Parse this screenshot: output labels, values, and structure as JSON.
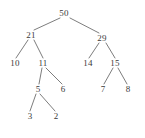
{
  "figure": {
    "kind": "binary-tree-diagram",
    "width": 145,
    "height": 138,
    "background_color": "#ffffff",
    "ink_color": "#3a3a3a",
    "edge_color": "#6e6e6e"
  },
  "chart_data": {
    "type": "diagram",
    "subtype": "binary-tree",
    "title": "",
    "root": "50",
    "nodes": [
      {
        "id": "n50",
        "label": "50",
        "x": 64,
        "y": 13,
        "depth": 0
      },
      {
        "id": "n21",
        "label": "21",
        "x": 31,
        "y": 35,
        "depth": 1
      },
      {
        "id": "n29",
        "label": "29",
        "x": 102,
        "y": 38,
        "depth": 1
      },
      {
        "id": "n10",
        "label": "10",
        "x": 15,
        "y": 63,
        "depth": 2
      },
      {
        "id": "n11",
        "label": "11",
        "x": 43,
        "y": 63,
        "depth": 2
      },
      {
        "id": "n14",
        "label": "14",
        "x": 88,
        "y": 63,
        "depth": 2
      },
      {
        "id": "n15",
        "label": "15",
        "x": 115,
        "y": 63,
        "depth": 2
      },
      {
        "id": "n5",
        "label": "5",
        "x": 38,
        "y": 89,
        "depth": 3
      },
      {
        "id": "n6",
        "label": "6",
        "x": 63,
        "y": 89,
        "depth": 3
      },
      {
        "id": "n7",
        "label": "7",
        "x": 103,
        "y": 89,
        "depth": 3
      },
      {
        "id": "n8",
        "label": "8",
        "x": 128,
        "y": 89,
        "depth": 3
      },
      {
        "id": "n3",
        "label": "3",
        "x": 30,
        "y": 116,
        "depth": 4
      },
      {
        "id": "n2",
        "label": "2",
        "x": 56,
        "y": 116,
        "depth": 4
      }
    ],
    "edges": [
      {
        "from": "n50",
        "to": "n21",
        "x1": 60,
        "y1": 18,
        "x2": 34,
        "y2": 30
      },
      {
        "from": "n50",
        "to": "n29",
        "x1": 70,
        "y1": 18,
        "x2": 99,
        "y2": 33
      },
      {
        "from": "n21",
        "to": "n10",
        "x1": 28,
        "y1": 40,
        "x2": 16,
        "y2": 58
      },
      {
        "from": "n21",
        "to": "n11",
        "x1": 34,
        "y1": 40,
        "x2": 43,
        "y2": 58
      },
      {
        "from": "n29",
        "to": "n14",
        "x1": 99,
        "y1": 43,
        "x2": 89,
        "y2": 58
      },
      {
        "from": "n29",
        "to": "n15",
        "x1": 106,
        "y1": 43,
        "x2": 115,
        "y2": 58
      },
      {
        "from": "n11",
        "to": "n5",
        "x1": 42,
        "y1": 68,
        "x2": 39,
        "y2": 84
      },
      {
        "from": "n11",
        "to": "n6",
        "x1": 46,
        "y1": 68,
        "x2": 62,
        "y2": 84
      },
      {
        "from": "n15",
        "to": "n7",
        "x1": 113,
        "y1": 68,
        "x2": 104,
        "y2": 84
      },
      {
        "from": "n15",
        "to": "n8",
        "x1": 118,
        "y1": 68,
        "x2": 127,
        "y2": 84
      },
      {
        "from": "n5",
        "to": "n3",
        "x1": 36,
        "y1": 94,
        "x2": 30,
        "y2": 111
      },
      {
        "from": "n5",
        "to": "n2",
        "x1": 40,
        "y1": 94,
        "x2": 55,
        "y2": 111
      }
    ],
    "adjacency": {
      "50": [
        "21",
        "29"
      ],
      "21": [
        "10",
        "11"
      ],
      "29": [
        "14",
        "15"
      ],
      "11": [
        "5",
        "6"
      ],
      "15": [
        "7",
        "8"
      ],
      "5": [
        "3",
        "2"
      ],
      "10": [],
      "14": [],
      "6": [],
      "7": [],
      "8": [],
      "3": [],
      "2": []
    },
    "leaves": [
      "10",
      "6",
      "14",
      "7",
      "8",
      "3",
      "2"
    ],
    "values_by_level": [
      [
        "50"
      ],
      [
        "21",
        "29"
      ],
      [
        "10",
        "11",
        "14",
        "15"
      ],
      [
        "5",
        "6",
        "7",
        "8"
      ],
      [
        "3",
        "2"
      ]
    ]
  }
}
